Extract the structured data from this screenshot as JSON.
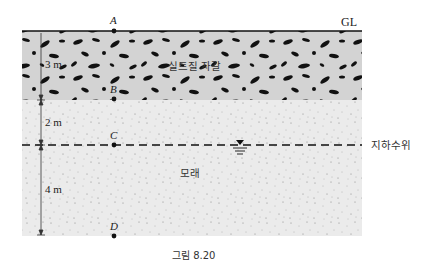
{
  "figure": {
    "caption": "그림 8.20",
    "ground_line_label": "GL",
    "water_table_label": "지하수위",
    "layers": [
      {
        "name": "실트질 자갈",
        "thickness_label": "3 m",
        "fill": "#d4d4d4"
      },
      {
        "name": "모래",
        "fill": "#ececec"
      }
    ],
    "dimensions": {
      "upper_sand_label": "2 m",
      "lower_sand_label": "4 m"
    },
    "points": {
      "a": "A",
      "b": "B",
      "c": "C",
      "d": "D"
    }
  }
}
